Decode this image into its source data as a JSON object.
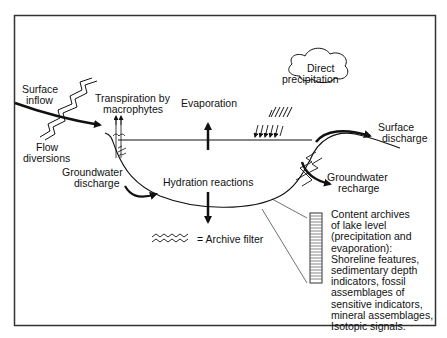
{
  "diagram": {
    "type": "lake hydrological balance and archive filter",
    "colors": {
      "ink": "#111111",
      "background": "#ffffff",
      "frame": "#333333",
      "hatch": "#555555"
    },
    "labels": {
      "surface_inflow": [
        "Surface",
        "inflow"
      ],
      "flow_diversions": [
        "Flow",
        "diversions"
      ],
      "transpiration": [
        "Transpiration by",
        "macrophytes"
      ],
      "evaporation": "Evaporation",
      "direct_precipitation": [
        "Direct",
        "precipitation"
      ],
      "surface_discharge": [
        "Surface",
        "discharge"
      ],
      "groundwater_discharge": [
        "Groundwater",
        "discharge"
      ],
      "hydration_reactions": "Hydration reactions",
      "groundwater_recharge": [
        "Groundwater",
        "recharge"
      ],
      "archive_filter_legend": "= Archive filter",
      "content_archives": [
        "Content archives",
        "of lake level",
        "(precipitation and",
        "evaporation):",
        "Shoreline features,",
        "sedimentary depth",
        "indicators, fossil",
        "assemblages of",
        "sensitive indicators,",
        "mineral assemblages,",
        "Isotopic signals."
      ]
    },
    "icons": {
      "cloud": "cloud-icon",
      "rain": "rain-hatch-icon",
      "archive_filter": "zigzag-filter-icon",
      "sediment_core": "sediment-core-icon",
      "macrophyte": "plant-icon"
    }
  }
}
